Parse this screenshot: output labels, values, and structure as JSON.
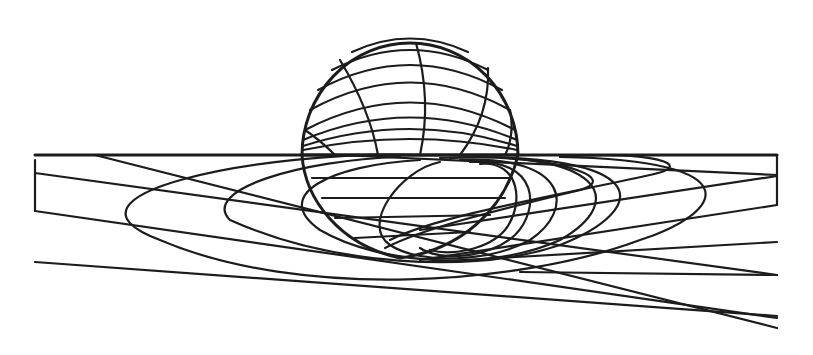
{
  "diagram": {
    "title": "",
    "stroke_color": "#1c1c1c",
    "background": "#ffffff",
    "sphere": {
      "cx": 410,
      "cy": 155,
      "r": 108
    },
    "ground_rect": {
      "x": 35,
      "y": 155,
      "w": 742,
      "h": 60
    },
    "horizon_y": 155,
    "straight_lines": [
      [
        35,
        155,
        777,
        155
      ],
      [
        35,
        188,
        777,
        275
      ],
      [
        35,
        213,
        340,
        245
      ],
      [
        35,
        262,
        777,
        315
      ],
      [
        170,
        155,
        777,
        330
      ],
      [
        777,
        188,
        400,
        260
      ],
      [
        777,
        240,
        420,
        258
      ],
      [
        777,
        275,
        560,
        275
      ]
    ]
  }
}
